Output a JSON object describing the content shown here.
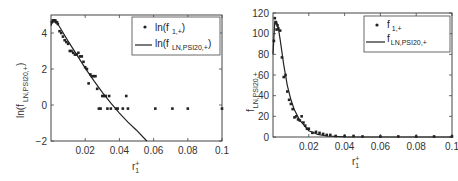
{
  "chart_data": [
    {
      "type": "scatter",
      "title": "",
      "xlabel": "r1+",
      "ylabel": "ln(f LN,PSI20,+)",
      "xlim": [
        0,
        0.1
      ],
      "ylim": [
        -2,
        5
      ],
      "xticks": [
        "0.02",
        "0.04",
        "0.06",
        "0.08",
        "0.1"
      ],
      "yticks": [
        "-2",
        "0",
        "2",
        "4"
      ],
      "grid": false,
      "legend_position": "upper right",
      "series": [
        {
          "name": "ln(f 1,+)",
          "style": "points",
          "x": [
            0.0005,
            0.001,
            0.0015,
            0.002,
            0.0025,
            0.003,
            0.0035,
            0.004,
            0.005,
            0.006,
            0.007,
            0.008,
            0.009,
            0.01,
            0.011,
            0.012,
            0.013,
            0.014,
            0.015,
            0.016,
            0.017,
            0.018,
            0.019,
            0.02,
            0.021,
            0.022,
            0.023,
            0.024,
            0.025,
            0.026,
            0.027,
            0.028,
            0.029,
            0.03,
            0.031,
            0.032,
            0.033,
            0.034,
            0.035,
            0.038,
            0.039,
            0.042,
            0.044,
            0.045,
            0.061,
            0.071,
            0.08,
            0.1
          ],
          "y": [
            4.6,
            4.7,
            4.7,
            4.65,
            4.7,
            4.6,
            4.6,
            4.5,
            4.1,
            4.0,
            3.8,
            3.6,
            3.5,
            3.4,
            3.0,
            3.0,
            2.9,
            2.8,
            2.8,
            2.9,
            2.7,
            2.7,
            2.4,
            2.1,
            2.0,
            1.2,
            1.7,
            1.6,
            1.6,
            1.6,
            0.9,
            -0.2,
            -0.2,
            0.5,
            0.5,
            0.5,
            -0.2,
            0.5,
            -0.2,
            -0.2,
            -0.2,
            -0.2,
            0.5,
            -0.2,
            -0.2,
            -0.2,
            -0.2,
            -0.2
          ]
        },
        {
          "name": "ln(f LN,PSI20,+)",
          "style": "line",
          "x": [
            0.0,
            0.001,
            0.002,
            0.003,
            0.005,
            0.01,
            0.015,
            0.02,
            0.025,
            0.03,
            0.035,
            0.04,
            0.045,
            0.05,
            0.056
          ],
          "y": [
            4.4,
            4.7,
            4.72,
            4.65,
            4.35,
            3.55,
            2.8,
            2.05,
            1.35,
            0.7,
            0.1,
            -0.45,
            -0.95,
            -1.4,
            -2.0
          ]
        }
      ]
    },
    {
      "type": "scatter",
      "title": "",
      "xlabel": "r1+",
      "ylabel": "f LN,PSI20,+",
      "xlim": [
        0,
        0.1
      ],
      "ylim": [
        0,
        120
      ],
      "xticks": [
        "0.02",
        "0.04",
        "0.06",
        "0.08",
        "0.1"
      ],
      "yticks": [
        "0",
        "20",
        "40",
        "60",
        "80",
        "100",
        "120"
      ],
      "grid": false,
      "legend_position": "upper right",
      "series": [
        {
          "name": "f 1,+",
          "style": "points",
          "x": [
            0.0005,
            0.001,
            0.0015,
            0.002,
            0.0025,
            0.003,
            0.004,
            0.005,
            0.006,
            0.007,
            0.008,
            0.009,
            0.01,
            0.011,
            0.012,
            0.013,
            0.014,
            0.015,
            0.016,
            0.017,
            0.018,
            0.019,
            0.02,
            0.022,
            0.024,
            0.026,
            0.028,
            0.03,
            0.032,
            0.035,
            0.04,
            0.045,
            0.05,
            0.06,
            0.07,
            0.08,
            0.09,
            0.1
          ],
          "y": [
            93,
            115,
            110,
            104,
            108,
            105,
            103,
            77,
            58,
            60,
            44,
            36,
            32,
            27,
            19,
            20,
            17,
            16,
            20,
            14,
            11,
            8,
            8,
            4,
            5,
            4,
            3,
            2,
            2,
            1,
            1,
            1,
            0.5,
            0.5,
            0.5,
            0.5,
            0.5,
            0.5
          ]
        },
        {
          "name": "f LN,PSI20,+",
          "style": "line",
          "x": [
            0.0,
            0.001,
            0.002,
            0.003,
            0.004,
            0.006,
            0.008,
            0.01,
            0.012,
            0.015,
            0.02,
            0.025,
            0.03,
            0.04,
            0.06,
            0.1
          ],
          "y": [
            80,
            112,
            112,
            105,
            94,
            70,
            50,
            36,
            26,
            16,
            6,
            2.5,
            1,
            0.2,
            0,
            0
          ]
        }
      ]
    }
  ],
  "left": {
    "ylabel_main": "ln(f",
    "ylabel_sub": "LN,PSI20,+",
    "ylabel_close": ")",
    "xlabel_main": "r",
    "xlabel_sub": "1",
    "xlabel_sup": "+",
    "legend": [
      {
        "marker": "•",
        "main": "ln(f",
        "sub": "1,+",
        "close": ")"
      },
      {
        "marker": "—",
        "main": "ln(f",
        "sub": "LN,PSI20,+",
        "close": ")"
      }
    ]
  },
  "right": {
    "ylabel_main": "f",
    "ylabel_sub": "LN,PSI20,+",
    "xlabel_main": "r",
    "xlabel_sub": "1",
    "xlabel_sup": "+",
    "legend": [
      {
        "marker": "•",
        "main": "f",
        "sub": "1,+"
      },
      {
        "marker": "—",
        "main": "f",
        "sub": "LN,PSI20,+"
      }
    ]
  }
}
